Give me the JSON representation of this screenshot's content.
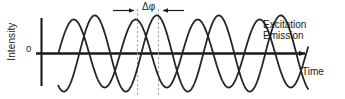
{
  "figure": {
    "name": "excitation-emission-phase-shift-diagram",
    "background": "#ffffff",
    "line_color": "#262626",
    "axis_color": "#1a1a1a",
    "guide_color": "#9a9a9a"
  },
  "axes": {
    "y_title": "Intensity",
    "y_zero_tick": "0",
    "x_title": "Time"
  },
  "legend": {
    "entries": [
      {
        "label": "Excitation"
      },
      {
        "label": "Emission"
      }
    ]
  },
  "annotation": {
    "phase_label": "Δφ"
  },
  "chart_data": {
    "type": "line",
    "title": "",
    "xlabel": "Time",
    "ylabel": "Intensity",
    "xlim": [
      0,
      4.35
    ],
    "ylim": [
      -1.25,
      1.25
    ],
    "grid": false,
    "legend_position": "right",
    "annotations": [
      {
        "text": "Δφ",
        "type": "phase-shift-span",
        "x_start": 1.02,
        "x_end": 1.36,
        "value_cycles": 0.34
      }
    ],
    "series": [
      {
        "name": "Excitation",
        "amplitude": 1.0,
        "period": 1.0,
        "phase_cycles": 0.0,
        "x_start": 0.27,
        "x_end": 4.3
      },
      {
        "name": "Emission",
        "amplitude": 1.12,
        "period": 1.0,
        "phase_cycles": -0.34,
        "x_start": 0.27,
        "x_end": 4.3
      }
    ]
  }
}
